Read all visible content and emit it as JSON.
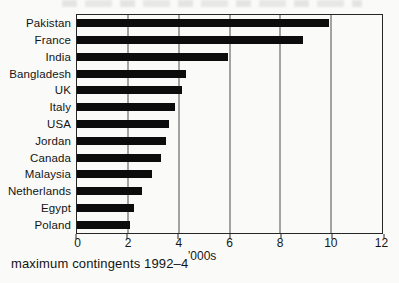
{
  "chart_data": {
    "type": "bar",
    "orientation": "horizontal",
    "title": "",
    "xlabel": "’000s",
    "ylabel": "",
    "caption": "maximum contingents 1992–4",
    "categories": [
      "Pakistan",
      "France",
      "India",
      "Bangladesh",
      "UK",
      "Italy",
      "USA",
      "Jordan",
      "Canada",
      "Malaysia",
      "Netherlands",
      "Egypt",
      "Poland"
    ],
    "values": [
      9.9,
      8.9,
      5.95,
      4.3,
      4.15,
      3.85,
      3.6,
      3.5,
      3.3,
      2.95,
      2.55,
      2.25,
      2.1
    ],
    "xlim": [
      0,
      12
    ],
    "xticks": [
      0,
      2,
      4,
      6,
      8,
      10,
      12
    ],
    "grid": "vertical gridlines at x ticks, full plot border",
    "legend": "none",
    "bar_color": "#0c0c0c",
    "axis_color": "#262626",
    "gridline_color": "#4d4d4d",
    "background_color": "#fafaf8"
  }
}
